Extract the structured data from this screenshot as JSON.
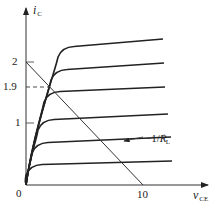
{
  "diagram": {
    "type": "transistor-output-characteristics",
    "y_axis": {
      "label": "i",
      "label_sub": "C",
      "ticks": [
        {
          "label": "2",
          "y": 62
        },
        {
          "label": "1.9",
          "y": 87
        },
        {
          "label": "1",
          "y": 123
        }
      ]
    },
    "x_axis": {
      "label": "v",
      "label_sub": "CE",
      "ticks": [
        {
          "label": "10",
          "x": 143
        }
      ]
    },
    "origin_label": "0",
    "load_line": {
      "label_prefix": "−1/",
      "label_main": "R",
      "label_sup": "′",
      "label_sub": "L",
      "from": [
        26,
        62
      ],
      "to": [
        143,
        185
      ]
    },
    "dashed_line": {
      "from": [
        26,
        87
      ],
      "to": [
        50,
        87
      ],
      "value_label": "1.9"
    },
    "curves": [
      {
        "knee_x": 62,
        "level_y": 47,
        "end_x": 163,
        "end_y": 39
      },
      {
        "knee_x": 55,
        "level_y": 70,
        "end_x": 164,
        "end_y": 63
      },
      {
        "knee_x": 48,
        "level_y": 92,
        "end_x": 165,
        "end_y": 87
      },
      {
        "knee_x": 42,
        "level_y": 120,
        "end_x": 168,
        "end_y": 114
      },
      {
        "knee_x": 36,
        "level_y": 143,
        "end_x": 171,
        "end_y": 137
      },
      {
        "knee_x": 30,
        "level_y": 165,
        "end_x": 172,
        "end_y": 161
      }
    ],
    "colors": {
      "line": "#222222",
      "background": "#ffffff"
    }
  }
}
